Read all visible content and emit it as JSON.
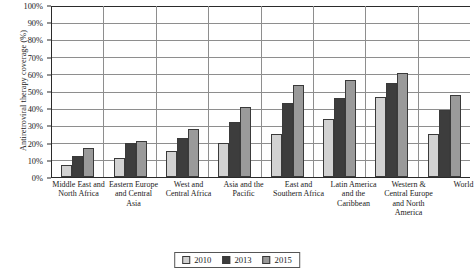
{
  "chart_data": {
    "type": "bar",
    "title": "",
    "xlabel": "",
    "ylabel": "Antiretroviral therapy coverage (%)",
    "ylim": [
      0,
      100
    ],
    "ytick_step": 10,
    "ytick_labels": [
      "100%",
      "90%",
      "80%",
      "70%",
      "60%",
      "50%",
      "40%",
      "30%",
      "20%",
      "10%",
      "0%"
    ],
    "grid": true,
    "legend_position": "bottom-center",
    "categories": [
      "Middle East and North Africa",
      "Eastern Europe and Central Asia",
      "West and Central Africa",
      "Asia and the Pacific",
      "East and Southern Africa",
      "Latin America and the Caribbean",
      "Western & Central Europe and North America",
      "World"
    ],
    "series": [
      {
        "name": "2010",
        "color": "#d2d2d2",
        "values": [
          7,
          11,
          15,
          20,
          25,
          34,
          47,
          25
        ]
      },
      {
        "name": "2013",
        "color": "#3d3d3d",
        "values": [
          12,
          20,
          23,
          32,
          43,
          46,
          55,
          39
        ]
      },
      {
        "name": "2015",
        "color": "#9a9a9a",
        "values": [
          17,
          21,
          28,
          41,
          54,
          57,
          61,
          48
        ]
      }
    ]
  },
  "legend": {
    "items": [
      {
        "label": "2010"
      },
      {
        "label": "2013"
      },
      {
        "label": "2015"
      }
    ]
  }
}
